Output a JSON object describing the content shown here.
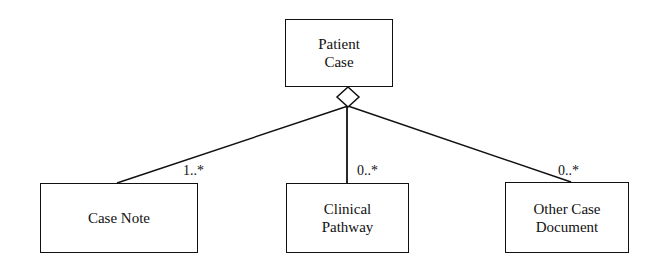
{
  "diagram": {
    "type": "UML class aggregation",
    "parent": {
      "label_line1": "Patient",
      "label_line2": "Case"
    },
    "children": [
      {
        "label_line1": "Case Note",
        "label_line2": "",
        "multiplicity": "1..*"
      },
      {
        "label_line1": "Clinical",
        "label_line2": "Pathway",
        "multiplicity": "0..*"
      },
      {
        "label_line1": "Other Case",
        "label_line2": "Document",
        "multiplicity": "0..*"
      }
    ],
    "colors": {
      "line": "#111111",
      "background": "#ffffff"
    }
  }
}
